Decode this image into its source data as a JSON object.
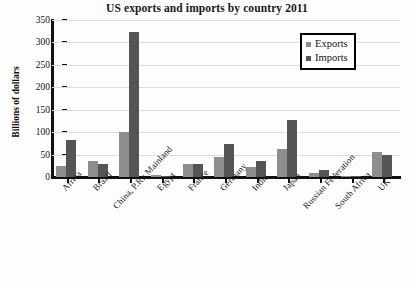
{
  "chart_data": {
    "type": "bar",
    "title": "US exports and imports by country 2011",
    "xlabel": "",
    "ylabel": "Billions of dollars",
    "ylim": [
      0,
      350
    ],
    "yticks": [
      0,
      50,
      100,
      150,
      200,
      250,
      300,
      350
    ],
    "ytick_labels": [
      "0",
      "50",
      "100",
      "150",
      "200",
      "250",
      "300",
      "350"
    ],
    "grid": true,
    "legend_position": "top-right",
    "categories": [
      "Africa",
      "Brazil",
      "China, P.R.: Mainland",
      "Egypt",
      "France",
      "Germany",
      "India",
      "Japan",
      "Russian Federation",
      "South Africa",
      "UK"
    ],
    "series": [
      {
        "name": "Exports",
        "color": "#8e8e8e",
        "values": [
          24,
          35,
          100,
          5,
          28,
          45,
          22,
          63,
          8,
          2,
          55
        ]
      },
      {
        "name": "Imports",
        "color": "#555555",
        "values": [
          82,
          28,
          323,
          2,
          30,
          73,
          36,
          128,
          16,
          2,
          50
        ]
      }
    ]
  },
  "legend": {
    "items": [
      {
        "label": "Exports",
        "swatch": "exports"
      },
      {
        "label": "Imports",
        "swatch": "imports"
      }
    ]
  }
}
